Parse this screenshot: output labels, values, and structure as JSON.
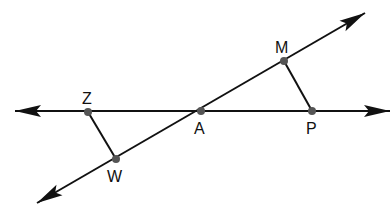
{
  "diagram": {
    "type": "geometry",
    "lines": [
      {
        "id": "horizontal-line",
        "from": [
          15,
          111
        ],
        "to": [
          390,
          111
        ],
        "arrows": "both"
      },
      {
        "id": "diagonal-line",
        "from": [
          37,
          203
        ],
        "to": [
          365,
          13
        ],
        "arrows": "both"
      }
    ],
    "segments": [
      {
        "id": "segment-ZW",
        "from": "Z",
        "to": "W"
      },
      {
        "id": "segment-MP",
        "from": "M",
        "to": "P"
      }
    ],
    "points": [
      {
        "name": "Z",
        "label": "Z",
        "x": 88,
        "y": 112,
        "label_x": 82,
        "label_y": 91
      },
      {
        "name": "A",
        "label": "A",
        "x": 201,
        "y": 111,
        "label_x": 194,
        "label_y": 121
      },
      {
        "name": "P",
        "label": "P",
        "x": 312,
        "y": 111,
        "label_x": 306,
        "label_y": 121
      },
      {
        "name": "M",
        "label": "M",
        "x": 284,
        "y": 61,
        "label_x": 275,
        "label_y": 40
      },
      {
        "name": "W",
        "label": "W",
        "x": 116,
        "y": 159,
        "label_x": 107,
        "label_y": 169
      }
    ],
    "colors": {
      "stroke": "#111111",
      "point": "#555555",
      "background": "#ffffff"
    }
  }
}
